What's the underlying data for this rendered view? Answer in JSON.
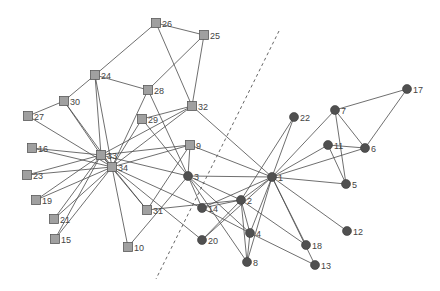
{
  "diagram": {
    "type": "network-graph",
    "colors": {
      "square_fill": "#a0a0a0",
      "circle_fill": "#505050",
      "edge": "#4a4a4a",
      "label": "#444444"
    },
    "divider": {
      "x1": 279,
      "y1": 31,
      "x2": 156,
      "y2": 279
    },
    "nodes": [
      {
        "id": "1",
        "shape": "circle",
        "x": 272,
        "y": 177
      },
      {
        "id": "2",
        "shape": "circle",
        "x": 241,
        "y": 200
      },
      {
        "id": "3",
        "shape": "circle",
        "x": 188,
        "y": 176
      },
      {
        "id": "4",
        "shape": "circle",
        "x": 250,
        "y": 233
      },
      {
        "id": "5",
        "shape": "circle",
        "x": 346,
        "y": 184
      },
      {
        "id": "6",
        "shape": "circle",
        "x": 365,
        "y": 148
      },
      {
        "id": "7",
        "shape": "circle",
        "x": 335,
        "y": 110
      },
      {
        "id": "8",
        "shape": "circle",
        "x": 247,
        "y": 262
      },
      {
        "id": "9",
        "shape": "square",
        "x": 190,
        "y": 145
      },
      {
        "id": "10",
        "shape": "square",
        "x": 128,
        "y": 247
      },
      {
        "id": "11",
        "shape": "circle",
        "x": 328,
        "y": 145
      },
      {
        "id": "12",
        "shape": "circle",
        "x": 347,
        "y": 231
      },
      {
        "id": "13",
        "shape": "circle",
        "x": 315,
        "y": 265
      },
      {
        "id": "14",
        "shape": "circle",
        "x": 202,
        "y": 208
      },
      {
        "id": "15",
        "shape": "square",
        "x": 55,
        "y": 239
      },
      {
        "id": "16",
        "shape": "square",
        "x": 32,
        "y": 148
      },
      {
        "id": "17",
        "shape": "circle",
        "x": 407,
        "y": 89
      },
      {
        "id": "18",
        "shape": "circle",
        "x": 306,
        "y": 245
      },
      {
        "id": "19",
        "shape": "square",
        "x": 36,
        "y": 200
      },
      {
        "id": "20",
        "shape": "circle",
        "x": 202,
        "y": 240
      },
      {
        "id": "21",
        "shape": "square",
        "x": 54,
        "y": 219
      },
      {
        "id": "22",
        "shape": "circle",
        "x": 294,
        "y": 117
      },
      {
        "id": "23",
        "shape": "square",
        "x": 27,
        "y": 175
      },
      {
        "id": "24",
        "shape": "square",
        "x": 95,
        "y": 75
      },
      {
        "id": "25",
        "shape": "square",
        "x": 204,
        "y": 35
      },
      {
        "id": "26",
        "shape": "square",
        "x": 156,
        "y": 23
      },
      {
        "id": "27",
        "shape": "square",
        "x": 28,
        "y": 116
      },
      {
        "id": "28",
        "shape": "square",
        "x": 148,
        "y": 90
      },
      {
        "id": "29",
        "shape": "square",
        "x": 142,
        "y": 119
      },
      {
        "id": "30",
        "shape": "square",
        "x": 64,
        "y": 101
      },
      {
        "id": "31",
        "shape": "square",
        "x": 147,
        "y": 210
      },
      {
        "id": "32",
        "shape": "square",
        "x": 192,
        "y": 106
      },
      {
        "id": "33",
        "shape": "square",
        "x": 101,
        "y": 155
      },
      {
        "id": "34",
        "shape": "square",
        "x": 112,
        "y": 167
      }
    ],
    "edges": [
      [
        "1",
        "2"
      ],
      [
        "1",
        "3"
      ],
      [
        "1",
        "4"
      ],
      [
        "1",
        "5"
      ],
      [
        "1",
        "6"
      ],
      [
        "1",
        "7"
      ],
      [
        "1",
        "8"
      ],
      [
        "1",
        "9"
      ],
      [
        "1",
        "11"
      ],
      [
        "1",
        "12"
      ],
      [
        "1",
        "13"
      ],
      [
        "1",
        "14"
      ],
      [
        "1",
        "18"
      ],
      [
        "1",
        "20"
      ],
      [
        "1",
        "22"
      ],
      [
        "1",
        "32"
      ],
      [
        "2",
        "3"
      ],
      [
        "2",
        "4"
      ],
      [
        "2",
        "8"
      ],
      [
        "2",
        "14"
      ],
      [
        "2",
        "18"
      ],
      [
        "2",
        "20"
      ],
      [
        "2",
        "22"
      ],
      [
        "2",
        "31"
      ],
      [
        "3",
        "4"
      ],
      [
        "3",
        "8"
      ],
      [
        "3",
        "9"
      ],
      [
        "3",
        "10"
      ],
      [
        "3",
        "14"
      ],
      [
        "3",
        "28"
      ],
      [
        "3",
        "29"
      ],
      [
        "3",
        "33"
      ],
      [
        "4",
        "8"
      ],
      [
        "4",
        "13"
      ],
      [
        "4",
        "14"
      ],
      [
        "5",
        "7"
      ],
      [
        "5",
        "11"
      ],
      [
        "6",
        "7"
      ],
      [
        "6",
        "11"
      ],
      [
        "6",
        "17"
      ],
      [
        "7",
        "17"
      ],
      [
        "9",
        "31"
      ],
      [
        "9",
        "33"
      ],
      [
        "9",
        "34"
      ],
      [
        "10",
        "34"
      ],
      [
        "14",
        "34"
      ],
      [
        "15",
        "33"
      ],
      [
        "15",
        "34"
      ],
      [
        "16",
        "33"
      ],
      [
        "16",
        "34"
      ],
      [
        "19",
        "33"
      ],
      [
        "19",
        "34"
      ],
      [
        "20",
        "34"
      ],
      [
        "21",
        "33"
      ],
      [
        "21",
        "34"
      ],
      [
        "23",
        "33"
      ],
      [
        "23",
        "34"
      ],
      [
        "24",
        "26"
      ],
      [
        "24",
        "28"
      ],
      [
        "24",
        "30"
      ],
      [
        "24",
        "33"
      ],
      [
        "24",
        "34"
      ],
      [
        "25",
        "26"
      ],
      [
        "25",
        "28"
      ],
      [
        "25",
        "32"
      ],
      [
        "26",
        "32"
      ],
      [
        "27",
        "30"
      ],
      [
        "27",
        "34"
      ],
      [
        "28",
        "34"
      ],
      [
        "29",
        "32"
      ],
      [
        "29",
        "34"
      ],
      [
        "30",
        "33"
      ],
      [
        "30",
        "34"
      ],
      [
        "31",
        "33"
      ],
      [
        "31",
        "34"
      ],
      [
        "32",
        "33"
      ],
      [
        "32",
        "34"
      ],
      [
        "33",
        "34"
      ]
    ]
  }
}
